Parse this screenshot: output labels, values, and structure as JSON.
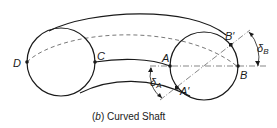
{
  "diagram": {
    "caption_prefix": "(",
    "caption_letter": "b",
    "caption_suffix": ") Curved Shaft",
    "points": {
      "D": "D",
      "C": "C",
      "A": "A",
      "A_prime": "A′",
      "B": "B",
      "B_prime": "B′"
    },
    "angles": {
      "delta_A_symbol": "δ",
      "delta_A_sub": "A",
      "delta_B_symbol": "δ",
      "delta_B_sub": "B"
    },
    "colors": {
      "line": "#1a1a1a",
      "dashed": "#555555",
      "background": "#ffffff"
    }
  }
}
